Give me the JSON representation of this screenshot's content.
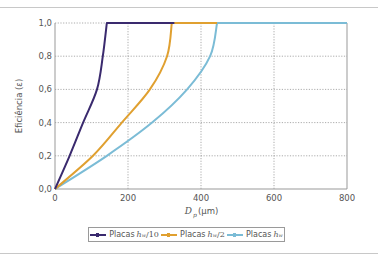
{
  "chart_data": {
    "type": "line",
    "title": "",
    "xlabel": "D_p (µm)",
    "ylabel": "Eficiência (ε)",
    "xlim": [
      0,
      800
    ],
    "ylim": [
      0.0,
      1.0
    ],
    "x_ticks": [
      "0",
      "200",
      "400",
      "600",
      "800"
    ],
    "y_ticks": [
      "0,0",
      "0,2",
      "0,4",
      "0,6",
      "0,8",
      "1,0"
    ],
    "grid": true,
    "legend_position": "bottom",
    "series": [
      {
        "name": "Placas h_w/10",
        "color": "#3a2a6e",
        "x": [
          0,
          40,
          77,
          115,
          131,
          142,
          327
        ],
        "y": [
          0.0,
          0.2,
          0.4,
          0.6,
          0.8,
          1.0,
          1.0
        ]
      },
      {
        "name": "Placas h_w/2",
        "color": "#e0a030",
        "x": [
          0,
          104,
          183,
          260,
          307,
          320,
          444
        ],
        "y": [
          0.0,
          0.2,
          0.4,
          0.6,
          0.8,
          1.0,
          1.0
        ]
      },
      {
        "name": "Placas h_w",
        "color": "#7bbcd6",
        "x": [
          0,
          142,
          266,
          362,
          425,
          444,
          800
        ],
        "y": [
          0.0,
          0.2,
          0.4,
          0.6,
          0.8,
          1.0,
          1.0
        ]
      }
    ]
  },
  "axes": {
    "xlabel_var": "D",
    "xlabel_sub": "p",
    "xlabel_unit": "(µm)",
    "ylabel": "Eficiência (ε)"
  },
  "legend": [
    {
      "prefix": "Placas",
      "var": "h",
      "sub": "w",
      "suffix": "/10",
      "color": "#3a2a6e"
    },
    {
      "prefix": "Placas",
      "var": "h",
      "sub": "w",
      "suffix": "/2",
      "color": "#e0a030"
    },
    {
      "prefix": "Placas",
      "var": "h",
      "sub": "w",
      "suffix": "",
      "color": "#7bbcd6"
    }
  ]
}
